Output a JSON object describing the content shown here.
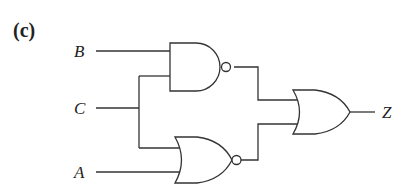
{
  "figure": {
    "panel_label": "(c)",
    "inputs": [
      {
        "name": "B"
      },
      {
        "name": "C"
      },
      {
        "name": "A"
      }
    ],
    "output": {
      "name": "Z"
    },
    "gates": [
      {
        "id": "g1",
        "type": "NAND",
        "inputs": [
          "B",
          "C"
        ]
      },
      {
        "id": "g2",
        "type": "NOR",
        "inputs": [
          "C",
          "A"
        ]
      },
      {
        "id": "g3",
        "type": "OR",
        "inputs": [
          "g1",
          "g2"
        ],
        "output": "Z"
      }
    ]
  }
}
